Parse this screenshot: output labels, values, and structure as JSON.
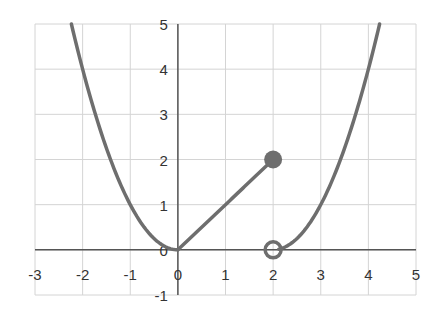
{
  "chart_data": {
    "type": "line",
    "title": "",
    "xlabel": "",
    "ylabel": "",
    "xlim": [
      -3,
      5
    ],
    "ylim": [
      -1,
      5
    ],
    "grid": true,
    "legend": null,
    "x_ticks": [
      -3,
      -2,
      -1,
      0,
      1,
      2,
      3,
      4,
      5
    ],
    "y_ticks": [
      -1,
      0,
      1,
      2,
      3,
      4,
      5
    ],
    "series": [
      {
        "name": "piece 1: y = x^2 (x <= 0)",
        "x": [
          -2.24,
          -2,
          -1.5,
          -1,
          -0.5,
          0
        ],
        "y": [
          5,
          4,
          2.25,
          1,
          0.25,
          0
        ]
      },
      {
        "name": "piece 2: y = x (0 < x <= 2)",
        "x": [
          0,
          1,
          2
        ],
        "y": [
          0,
          1,
          2
        ]
      },
      {
        "name": "piece 3: y = (x-2)^2 (x > 2)",
        "x": [
          2,
          2.5,
          3,
          3.5,
          4,
          4.24
        ],
        "y": [
          0,
          0.25,
          1,
          2.25,
          4,
          5
        ]
      }
    ],
    "markers": [
      {
        "x": 2,
        "y": 2,
        "style": "filled",
        "label": "closed point"
      },
      {
        "x": 2,
        "y": 0,
        "style": "open",
        "label": "open point"
      }
    ],
    "colors": {
      "curve": "#6e6e6e",
      "grid": "#d4d4d4",
      "axis": "#555555"
    }
  }
}
